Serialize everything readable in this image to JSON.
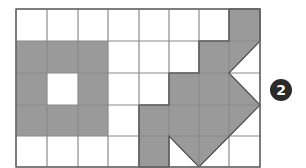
{
  "grid": {
    "rows": 5,
    "cols": 8,
    "x_lines": [
      16,
      47,
      78,
      108,
      139,
      169,
      199,
      229,
      260
    ],
    "y_lines": [
      9,
      41,
      73,
      105,
      136,
      167
    ],
    "line_color": "#8a8a8a",
    "border_color": "#666666",
    "fill_color": "#9a9a9a"
  },
  "shapes": [
    {
      "name": "left-shape-with-hole",
      "description": "3x3 square block (rows 1-3, cols 0-2) with center cell empty",
      "filled_cells": [
        [
          1,
          0
        ],
        [
          1,
          1
        ],
        [
          1,
          2
        ],
        [
          2,
          0
        ],
        [
          2,
          2
        ],
        [
          3,
          0
        ],
        [
          3,
          1
        ],
        [
          3,
          2
        ]
      ]
    },
    {
      "name": "right-arrow-shape",
      "description": "Irregular polygon with a left-pointing notch and diagonal edges",
      "points": "229,9 260,9 260,41 229,73 260,105 199,167 169,136 169,167 139,167 139,105 169,105 169,73 199,73 199,41 229,41"
    }
  ],
  "badge": {
    "label": "2"
  }
}
